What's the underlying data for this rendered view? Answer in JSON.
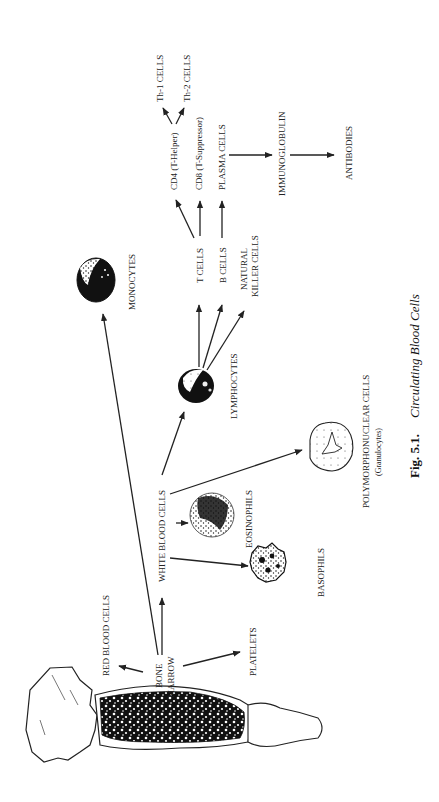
{
  "figure": {
    "caption_number": "Fig. 5.1.",
    "caption_title": "Circulating Blood Cells",
    "orientation": "rotated 90° (text reads bottom-to-top)"
  },
  "nodes": {
    "bone": "BONE",
    "marrow": "MARROW",
    "red_blood_cells": "RED BLOOD CELLS",
    "platelets": "PLATELETS",
    "white_blood_cells": "WHITE BLOOD CELLS",
    "monocytes": "MONOCYTES",
    "lymphocytes": "LYMPHOCYTES",
    "eosinophils": "EOSINOPHILS",
    "basophils": "BASOPHILS",
    "polymorphonuclear": "POLYMORPHONUCLEAR CELLS",
    "granulocytes": "(Granulocytes)",
    "t_cells": "T CELLS",
    "b_cells": "B CELLS",
    "natural": "NATURAL",
    "killer_cells": "KILLER CELLS",
    "cd4": "CD4 (T-Helper)",
    "cd8": "CD8 (T-Suppressor)",
    "plasma_cells": "PLASMA CELLS",
    "th1": "Th-1 CELLS",
    "th2": "Th-2 CELLS",
    "immunoglobulin": "IMMUNOGLOBULIN",
    "antibodies": "ANTIBODIES"
  },
  "edges": [
    [
      "BONE MARROW",
      "RED BLOOD CELLS"
    ],
    [
      "BONE MARROW",
      "PLATELETS"
    ],
    [
      "BONE MARROW",
      "WHITE BLOOD CELLS"
    ],
    [
      "BONE MARROW",
      "MONOCYTES"
    ],
    [
      "WHITE BLOOD CELLS",
      "LYMPHOCYTES"
    ],
    [
      "WHITE BLOOD CELLS",
      "EOSINOPHILS"
    ],
    [
      "WHITE BLOOD CELLS",
      "BASOPHILS"
    ],
    [
      "WHITE BLOOD CELLS",
      "POLYMORPHONUCLEAR CELLS"
    ],
    [
      "LYMPHOCYTES",
      "T CELLS"
    ],
    [
      "LYMPHOCYTES",
      "B CELLS"
    ],
    [
      "LYMPHOCYTES",
      "NATURAL KILLER CELLS"
    ],
    [
      "T CELLS",
      "CD4 (T-Helper)"
    ],
    [
      "T CELLS",
      "CD8 (T-Suppressor)"
    ],
    [
      "B CELLS",
      "PLASMA CELLS"
    ],
    [
      "CD4 (T-Helper)",
      "Th-1 CELLS"
    ],
    [
      "CD4 (T-Helper)",
      "Th-2 CELLS"
    ],
    [
      "PLASMA CELLS",
      "IMMUNOGLOBULIN"
    ],
    [
      "IMMUNOGLOBULIN",
      "ANTIBODIES"
    ]
  ]
}
